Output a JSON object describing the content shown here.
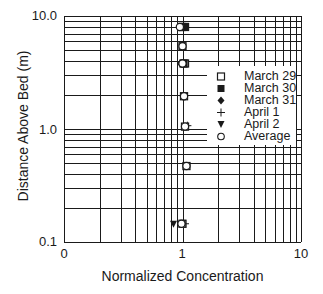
{
  "chart_data": {
    "type": "scatter",
    "title": "",
    "xlabel": "Normalized Concentration",
    "ylabel": "Distance Above Bed (m)",
    "xscale": "log",
    "yscale": "log",
    "xlim": [
      0.1,
      10
    ],
    "ylim": [
      0.1,
      10
    ],
    "xticks": [
      {
        "value": 0.1,
        "label": "0"
      },
      {
        "value": 1,
        "label": "1"
      },
      {
        "value": 10,
        "label": "10"
      }
    ],
    "yticks": [
      {
        "value": 0.1,
        "label": "0.1"
      },
      {
        "value": 1,
        "label": "1.0"
      },
      {
        "value": 10,
        "label": "10.0"
      }
    ],
    "grid": true,
    "legend_position": "right-middle inside",
    "series": [
      {
        "name": "March 29",
        "marker": "open-square",
        "points": [
          [
            0.98,
            8.0
          ],
          [
            1.0,
            5.4
          ],
          [
            1.05,
            3.8
          ],
          [
            1.03,
            1.95
          ],
          [
            1.05,
            1.05
          ],
          [
            1.08,
            0.47
          ],
          [
            1.0,
            0.145
          ]
        ]
      },
      {
        "name": "March 30",
        "marker": "filled-square",
        "points": [
          [
            1.05,
            8.0
          ],
          [
            1.02,
            3.8
          ]
        ]
      },
      {
        "name": "March 31",
        "marker": "filled-diamond",
        "points": [
          [
            0.96,
            3.8
          ]
        ]
      },
      {
        "name": "April 1",
        "marker": "plus",
        "points": [
          [
            1.1,
            1.07
          ],
          [
            1.05,
            0.145
          ]
        ]
      },
      {
        "name": "April 2",
        "marker": "filled-triangle-down",
        "points": [
          [
            0.84,
            0.145
          ]
        ]
      },
      {
        "name": "Average",
        "marker": "open-circle",
        "points": [
          [
            0.95,
            8.0
          ],
          [
            1.0,
            5.4
          ],
          [
            1.0,
            3.8
          ],
          [
            1.03,
            1.95
          ],
          [
            1.05,
            1.05
          ],
          [
            1.08,
            0.47
          ],
          [
            0.98,
            0.145
          ]
        ]
      }
    ]
  },
  "axes": {
    "x_title": "Normalized Concentration",
    "y_title": "Distance Above Bed (m)",
    "x_ticks": [
      "0",
      "1",
      "10"
    ],
    "y_ticks": [
      "10.0",
      "1.0",
      "0.1"
    ]
  },
  "legend": {
    "items": [
      {
        "label": "March 29",
        "symbol": "open-square"
      },
      {
        "label": "March 30",
        "symbol": "filled-square"
      },
      {
        "label": "March 31",
        "symbol": "filled-diamond"
      },
      {
        "label": "April 1",
        "symbol": "plus"
      },
      {
        "label": "April 2",
        "symbol": "filled-triangle-down"
      },
      {
        "label": "Average",
        "symbol": "open-circle"
      }
    ]
  },
  "colors": {
    "line": "#1a1a1a",
    "background": "#ffffff"
  }
}
